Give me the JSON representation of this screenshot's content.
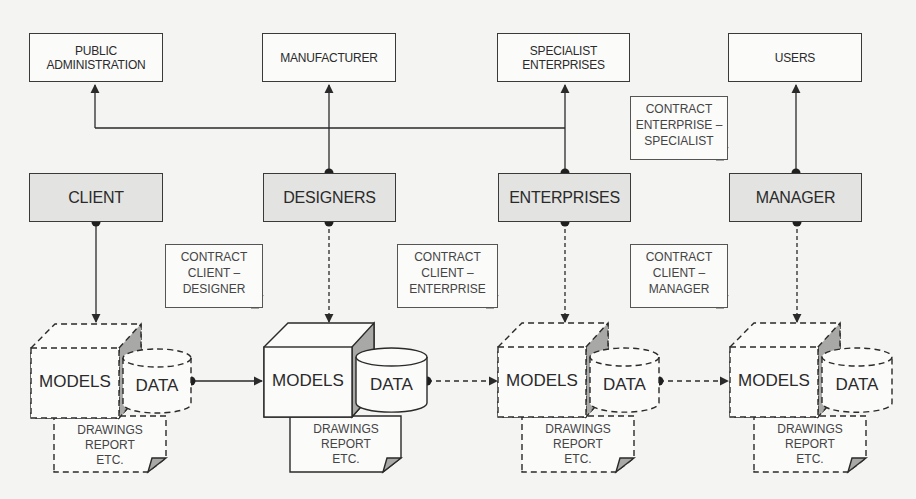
{
  "diagram": {
    "stakeholders": [
      {
        "id": "public-administration",
        "label_line1": "PUBLIC",
        "label_line2": "ADMINISTRATION"
      },
      {
        "id": "manufacturer",
        "label_line1": "MANUFACTURER",
        "label_line2": ""
      },
      {
        "id": "specialist-enterprises",
        "label_line1": "SPECIALIST",
        "label_line2": "ENTERPRISES"
      },
      {
        "id": "users",
        "label_line1": "USERS",
        "label_line2": ""
      }
    ],
    "roles": [
      {
        "id": "client",
        "label": "CLIENT"
      },
      {
        "id": "designers",
        "label": "DESIGNERS"
      },
      {
        "id": "enterprises",
        "label": "ENTERPRISES"
      },
      {
        "id": "manager",
        "label": "MANAGER"
      }
    ],
    "contracts": [
      {
        "id": "enterprise-specialist",
        "line1": "CONTRACT",
        "line2": "ENTERPRISE –",
        "line3": "SPECIALIST"
      },
      {
        "id": "client-designer",
        "line1": "CONTRACT",
        "line2": "CLIENT –",
        "line3": "DESIGNER"
      },
      {
        "id": "client-enterprise",
        "line1": "CONTRACT",
        "line2": "CLIENT –",
        "line3": "ENTERPRISE"
      },
      {
        "id": "client-manager",
        "line1": "CONTRACT",
        "line2": "CLIENT –",
        "line3": "MANAGER"
      }
    ],
    "bim_stages": [
      {
        "owner": "client",
        "models": "MODELS",
        "data": "DATA",
        "doc_line1": "DRAWINGS",
        "doc_line2": "REPORT",
        "doc_line3": "ETC.",
        "style": "dashed"
      },
      {
        "owner": "designers",
        "models": "MODELS",
        "data": "DATA",
        "doc_line1": "DRAWINGS",
        "doc_line2": "REPORT",
        "doc_line3": "ETC.",
        "style": "solid"
      },
      {
        "owner": "enterprises",
        "models": "MODELS",
        "data": "DATA",
        "doc_line1": "DRAWINGS",
        "doc_line2": "REPORT",
        "doc_line3": "ETC.",
        "style": "dashed"
      },
      {
        "owner": "manager",
        "models": "MODELS",
        "data": "DATA",
        "doc_line1": "DRAWINGS",
        "doc_line2": "REPORT",
        "doc_line3": "ETC.",
        "style": "dashed"
      }
    ],
    "colors": {
      "line": "#2a2a2a",
      "role_fill": "#e3e3e1",
      "box_fill": "#fbfbfa",
      "shade": "#9a9a98",
      "background": "#f4f4f2"
    }
  }
}
